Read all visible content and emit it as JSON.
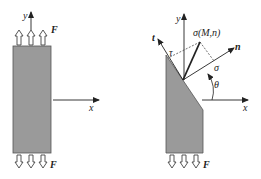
{
  "figure_left": {
    "axes": {
      "x_label": "x",
      "y_label": "y"
    },
    "force_label_top": "F",
    "force_label_bottom": "F",
    "body_fill": "#999999"
  },
  "figure_right": {
    "axes": {
      "x_label": "x",
      "y_label": "y",
      "n_label": "n",
      "t_label": "t"
    },
    "stress_vector_label": "σ(M,n)",
    "normal_stress_label": "σ",
    "shear_stress_label": "τ",
    "angle_label": "θ",
    "force_label_bottom": "F",
    "body_fill": "#999999"
  }
}
